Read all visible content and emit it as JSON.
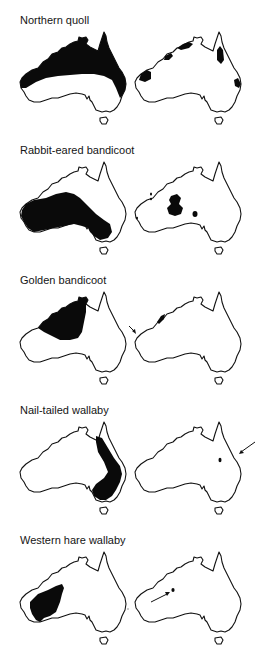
{
  "figure": {
    "panels": [
      {
        "species": "Northern quoll",
        "former_range": "northern-band",
        "current_range": "scattered-northern-patches",
        "arrow": null
      },
      {
        "species": "Rabbit-eared bandicoot",
        "former_range": "western-central-interior",
        "current_range": "central-patches",
        "arrow": null
      },
      {
        "species": "Golden bandicoot",
        "former_range": "north-west-block",
        "current_range": "kimberley-coast-patch",
        "arrow": "west-coast-island"
      },
      {
        "species": "Nail-tailed wallaby",
        "former_range": "eastern-inland-band",
        "current_range": "small-central-queensland-patch",
        "arrow": "east-pointing-patch"
      },
      {
        "species": "Western hare wallaby",
        "former_range": "south-west-interior",
        "current_range": "tiny-central-patch",
        "arrow": "pointing-central-patch"
      }
    ],
    "columns": [
      "former-distribution",
      "current-distribution"
    ],
    "colors": {
      "range_fill": "#0a0a0a",
      "outline": "#111111",
      "background": "#ffffff"
    }
  }
}
